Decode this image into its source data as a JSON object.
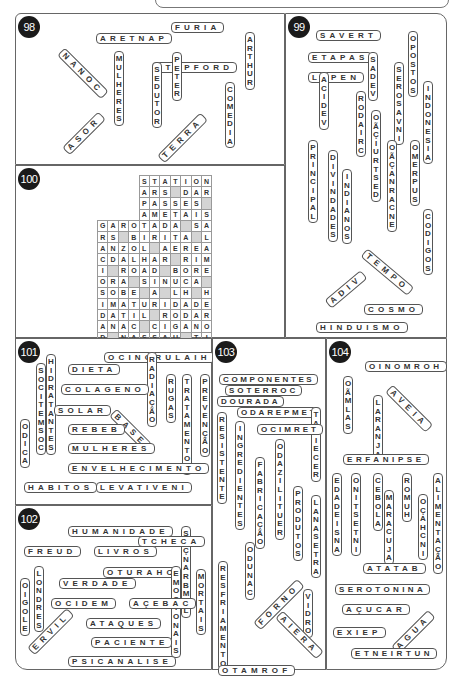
{
  "puzzles": [
    {
      "number": "98",
      "words": [
        "ARETNAP",
        "FURIA",
        "NANOC",
        "MULHERES",
        "STEPFORD",
        "PETER",
        "SEDUTOR",
        "ARTHUR",
        "COMEDIA",
        "ASOR",
        "TERRA"
      ]
    },
    {
      "number": "99",
      "words": [
        "SAVERT",
        "ETAPAS",
        "SADEV",
        "LAPEN",
        "VACIDEV",
        "RODAIRC",
        "OÃÇIURTSED",
        "SEROSAVNI",
        "OPOSTOS",
        "INDONESIA",
        "PRINCIPAL",
        "DIVINDADES",
        "INDIANOS",
        "OÃÇANRACNE",
        "OMERPUS",
        "CODIGOS",
        "TEMPO",
        "ADIV",
        "COSMO",
        "HINDUISMO"
      ]
    },
    {
      "number": "100",
      "grid": [
        [
          "",
          "",
          "",
          "",
          "STATION"
        ],
        [
          "",
          "",
          "",
          "",
          "ARS DAR"
        ],
        [
          "",
          "",
          "",
          "",
          "PASSES "
        ],
        [
          "",
          "",
          "",
          "",
          "AMETAIS"
        ]
      ],
      "rows": [
        "      STATION",
        "      ARS_DAR",
        "      PASSES_",
        "      AMETAIS",
        "GAROTADA_SA",
        "RS_BIRITA_L",
        "ANZOL_AEREA",
        "CDALHAR_RIM",
        "I_RODAD_BORE",
        "ORA_SINUCA_",
        "SOBE_A_LH_H",
        "IMATURIDADE",
        "DATIL_RODAR",
        "ANAC_CIGANO",
        "D_NASSAU_TI",
        "EZA_PAREDES"
      ]
    },
    {
      "number": "101",
      "words": [
        "OCINORULAIH",
        "DIETA",
        "SOCITEMSOC",
        "HIDRATANTES",
        "RADIAÇÃO",
        "RUGAS",
        "TRATAMENTOS",
        "PREVENÇÃO",
        "COLAGENO",
        "SOLAR",
        "BASE",
        "ODICA",
        "REBEB",
        "MULHERES",
        "ENVELHECIMENTO",
        "HABITOS",
        "LEVATIVENI"
      ]
    },
    {
      "number": "102",
      "words": [
        "HUMANIDADE",
        "SAÇNARBMEL",
        "TCHECA",
        "FREUD",
        "LIVROS",
        "OTURAHC",
        "EMOCIONAIS",
        "MORTAIS",
        "OIGOLE",
        "LONDRES",
        "VERDADE",
        "OCIDEM",
        "AÇEBAC",
        "ATAQUES",
        "ERVIL",
        "PACIENTE",
        "PSICANALISE"
      ]
    },
    {
      "number": "103",
      "words": [
        "COMPONENTES",
        "SOTERROC",
        "DOURADA",
        "ODAREPMET",
        "ATIECER",
        "OCIMRET",
        "RESISTENTE",
        "INGREDIENTES",
        "FABRICAÇÃO",
        "ODAZILITUER",
        "PRODUTOS",
        "LANASETRA",
        "ODUNAC",
        "RESFRIAMENTO",
        "FORNO",
        "VIDRO",
        "AIERA",
        "OTAMROF"
      ]
    },
    {
      "number": "104",
      "words": [
        "OINOMROH",
        "OÃMLAS",
        "AVEIA",
        "LARANJA",
        "ERFANIPSE",
        "EDADEISNA",
        "ONITSETNI",
        "CEBOLA",
        "MARACUJA",
        "ROMUH",
        "OÇAHCNI",
        "ALIMENTAÇÃO",
        "ATATAB",
        "SEROTONINA",
        "AÇUCAR",
        "EXIEP",
        "AGUA",
        "ETNEIRTUN"
      ]
    }
  ]
}
